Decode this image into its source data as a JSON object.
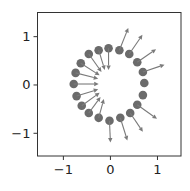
{
  "chart_data": {
    "type": "quiver",
    "title": "",
    "xlabel": "",
    "ylabel": "",
    "xlim": [
      -1.55,
      1.5
    ],
    "ylim": [
      -1.47,
      1.5
    ],
    "grid": false,
    "legend": null,
    "xticks": [
      -1,
      0,
      1
    ],
    "yticks": [
      -1,
      0,
      1
    ],
    "xtick_labels": [
      "−1",
      "0",
      "1"
    ],
    "ytick_labels": [
      "−1",
      "0",
      "1"
    ],
    "marker_color": "#6b6b6b",
    "arrow_color": "#7a7a7a",
    "points": [
      {
        "x": -0.04,
        "y": 0.76,
        "u": 0.0,
        "v": -0.45
      },
      {
        "x": 0.19,
        "y": 0.72,
        "u": 0.19,
        "v": 0.46
      },
      {
        "x": 0.4,
        "y": 0.64,
        "u": 0.28,
        "v": 0.4
      },
      {
        "x": 0.57,
        "y": 0.47,
        "u": 0.4,
        "v": 0.27
      },
      {
        "x": 0.69,
        "y": 0.27,
        "u": 0.46,
        "v": 0.15
      },
      {
        "x": 0.72,
        "y": 0.04,
        "u": 0.0,
        "v": 0.0
      },
      {
        "x": 0.69,
        "y": -0.21,
        "u": 0.0,
        "v": 0.0
      },
      {
        "x": 0.57,
        "y": -0.41,
        "u": 0.42,
        "v": -0.29
      },
      {
        "x": 0.42,
        "y": -0.58,
        "u": 0.27,
        "v": -0.39
      },
      {
        "x": 0.21,
        "y": -0.68,
        "u": 0.15,
        "v": -0.47
      },
      {
        "x": -0.02,
        "y": -0.74,
        "u": 0.02,
        "v": -0.45
      },
      {
        "x": -0.25,
        "y": -0.68,
        "u": 0.11,
        "v": 0.39
      },
      {
        "x": -0.46,
        "y": -0.58,
        "u": 0.25,
        "v": 0.33
      },
      {
        "x": -0.61,
        "y": -0.43,
        "u": 0.38,
        "v": 0.27
      },
      {
        "x": -0.72,
        "y": -0.23,
        "u": 0.46,
        "v": 0.14
      },
      {
        "x": -0.78,
        "y": 0.02,
        "u": 0.53,
        "v": 0.0
      },
      {
        "x": -0.74,
        "y": 0.25,
        "u": 0.48,
        "v": -0.12
      },
      {
        "x": -0.63,
        "y": 0.45,
        "u": 0.4,
        "v": -0.25
      },
      {
        "x": -0.46,
        "y": 0.64,
        "u": 0.27,
        "v": -0.37
      },
      {
        "x": -0.25,
        "y": 0.72,
        "u": 0.13,
        "v": -0.41
      }
    ]
  }
}
